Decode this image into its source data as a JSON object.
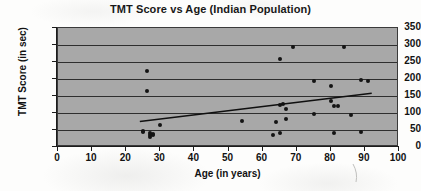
{
  "chart_data": {
    "type": "scatter",
    "title": "TMT Score vs Age (Indian Population)",
    "xlabel": "Age (in years)",
    "ylabel": "TMT Score (in sec)",
    "xlim": [
      0,
      100
    ],
    "ylim": [
      0,
      350
    ],
    "xticks": [
      0,
      10,
      20,
      30,
      40,
      50,
      60,
      70,
      80,
      90,
      100
    ],
    "yticks": [
      0,
      50,
      100,
      150,
      200,
      250,
      300,
      350
    ],
    "grid": "horizontal",
    "legend": "none",
    "plot_background": "#a8a8a8",
    "marker_color": "#141414",
    "trendline_color": "#101010",
    "x": [
      25,
      25,
      26,
      26,
      27,
      27,
      27,
      28,
      28,
      30,
      54,
      63,
      64,
      65,
      65,
      65,
      66,
      67,
      67,
      69,
      75,
      75,
      80,
      80,
      81,
      81,
      82,
      84,
      86,
      89,
      89,
      91
    ],
    "y": [
      48,
      44,
      165,
      225,
      30,
      36,
      40,
      38,
      34,
      64,
      77,
      34,
      73,
      41,
      123,
      260,
      127,
      82,
      111,
      295,
      96,
      195,
      134,
      178,
      42,
      121,
      120,
      293,
      95,
      43,
      198,
      193
    ],
    "series": [
      {
        "name": "TMT Score",
        "points": [
          {
            "age": 25,
            "score": 48
          },
          {
            "age": 25,
            "score": 44
          },
          {
            "age": 26,
            "score": 165
          },
          {
            "age": 26,
            "score": 225
          },
          {
            "age": 27,
            "score": 30
          },
          {
            "age": 27,
            "score": 36
          },
          {
            "age": 27,
            "score": 40
          },
          {
            "age": 28,
            "score": 38
          },
          {
            "age": 28,
            "score": 34
          },
          {
            "age": 30,
            "score": 64
          },
          {
            "age": 54,
            "score": 77
          },
          {
            "age": 63,
            "score": 34
          },
          {
            "age": 64,
            "score": 73
          },
          {
            "age": 65,
            "score": 41
          },
          {
            "age": 65,
            "score": 123
          },
          {
            "age": 65,
            "score": 260
          },
          {
            "age": 66,
            "score": 127
          },
          {
            "age": 67,
            "score": 82
          },
          {
            "age": 67,
            "score": 111
          },
          {
            "age": 69,
            "score": 295
          },
          {
            "age": 75,
            "score": 96
          },
          {
            "age": 75,
            "score": 195
          },
          {
            "age": 80,
            "score": 134
          },
          {
            "age": 80,
            "score": 178
          },
          {
            "age": 81,
            "score": 42
          },
          {
            "age": 81,
            "score": 121
          },
          {
            "age": 82,
            "score": 120
          },
          {
            "age": 84,
            "score": 293
          },
          {
            "age": 86,
            "score": 95
          },
          {
            "age": 89,
            "score": 43
          },
          {
            "age": 89,
            "score": 198
          },
          {
            "age": 91,
            "score": 193
          }
        ]
      }
    ],
    "trendline": {
      "x_start": 24,
      "y_start": 75,
      "x_end": 92,
      "y_end": 158
    }
  }
}
